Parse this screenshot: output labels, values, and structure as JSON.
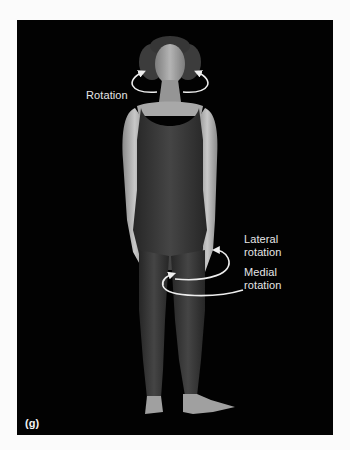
{
  "figure": {
    "panel_label": "(g)",
    "annotations": {
      "neck": "Rotation",
      "hip_lateral_line1": "Lateral",
      "hip_lateral_line2": "rotation",
      "hip_medial_line1": "Medial",
      "hip_medial_line2": "rotation"
    },
    "colors": {
      "background": "#020202",
      "label_text": "#e6e6e6",
      "arrow": "#eeeeee",
      "leotard": "#3a3a3a",
      "skin": "#b8b8b8"
    }
  }
}
